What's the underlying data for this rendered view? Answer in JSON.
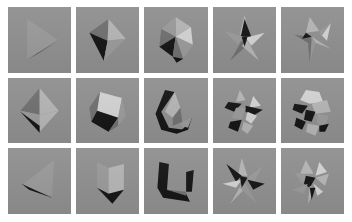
{
  "figure": {
    "kind": "image-grid",
    "rows": 3,
    "columns": 5,
    "background_color": "#ffffff",
    "tile_background_color": "#8f8f8f",
    "gutter_color": "#ffffff"
  },
  "palette": {
    "tile_bg": "#8f8f8f",
    "face_light": "#d2d2d2",
    "face_mid_light": "#b4b4b4",
    "face_mid": "#999999",
    "face_mid_dark": "#6f6f6f",
    "face_dark": "#3a3a3a",
    "face_black": "#141414",
    "page_bg": "#ffffff"
  },
  "tiles": [
    {
      "index": 1,
      "row": 1,
      "column": 1,
      "name": "right-pointing-triangle",
      "shape_label": "Triangle with dark sliver",
      "faces": [
        {
          "id": "r1c1-f1",
          "tone": "face_mid",
          "points": "20,12 20,52 52,33"
        },
        {
          "id": "r1c1-f2",
          "tone": "face_black",
          "points": "22,52 52,34 31,47"
        }
      ]
    },
    {
      "index": 2,
      "row": 1,
      "column": 2,
      "name": "tetrahedron-dark-face",
      "shape_label": "Tetrahedron",
      "faces": [
        {
          "id": "r1c2-f1",
          "tone": "face_mid_dark",
          "points": "14,26 34,12 33,34"
        },
        {
          "id": "r1c2-f2",
          "tone": "face_black",
          "points": "14,26 33,34 29,54"
        },
        {
          "id": "r1c2-f3",
          "tone": "face_mid_light",
          "points": "34,12 52,32 33,34"
        },
        {
          "id": "r1c2-f4",
          "tone": "face_mid",
          "points": "33,34 52,32 29,54"
        }
      ]
    },
    {
      "index": 3,
      "row": 1,
      "column": 3,
      "name": "icosahedron",
      "shape_label": "Icosahedron",
      "faces": [
        {
          "id": "r1c3-f1",
          "tone": "face_mid_light",
          "points": "33,10 49,20 33,30"
        },
        {
          "id": "r1c3-f2",
          "tone": "face_mid",
          "points": "33,10 33,30 18,22"
        },
        {
          "id": "r1c3-f3",
          "tone": "face_mid_dark",
          "points": "18,22 33,30 16,40"
        },
        {
          "id": "r1c3-f4",
          "tone": "face_black",
          "points": "16,40 33,30 30,50"
        },
        {
          "id": "r1c3-f5",
          "tone": "face_light",
          "points": "33,30 49,20 51,38"
        },
        {
          "id": "r1c3-f6",
          "tone": "face_mid",
          "points": "33,30 51,38 41,52"
        },
        {
          "id": "r1c3-f7",
          "tone": "face_mid_dark",
          "points": "30,50 33,30 41,52"
        },
        {
          "id": "r1c3-f8",
          "tone": "face_black",
          "points": "30,50 41,52 34,56"
        }
      ]
    },
    {
      "index": 4,
      "row": 1,
      "column": 4,
      "name": "five-point-star-stellation",
      "shape_label": "Stellated star polyhedron",
      "faces": [
        {
          "id": "r1c4-f1",
          "tone": "face_mid_light",
          "points": "33,8 38,28 28,28"
        },
        {
          "id": "r1c4-f2",
          "tone": "face_black",
          "points": "33,12 40,30 29,30"
        },
        {
          "id": "r1c4-f3",
          "tone": "face_mid",
          "points": "12,24 32,30 26,38"
        },
        {
          "id": "r1c4-f4",
          "tone": "face_light",
          "points": "54,26 34,31 40,39"
        },
        {
          "id": "r1c4-f5",
          "tone": "face_mid_dark",
          "points": "18,54 30,34 36,38"
        },
        {
          "id": "r1c4-f6",
          "tone": "face_mid_light",
          "points": "48,54 36,34 30,39"
        },
        {
          "id": "r1c4-f7",
          "tone": "face_black",
          "points": "30,30 36,30 33,40"
        }
      ]
    },
    {
      "index": 5,
      "row": 1,
      "column": 5,
      "name": "four-point-star-spike",
      "shape_label": "Four-pointed spiked polyhedron",
      "faces": [
        {
          "id": "r1c5-f1",
          "tone": "face_mid_light",
          "points": "30,10 40,24 26,26"
        },
        {
          "id": "r1c5-f2",
          "tone": "face_light",
          "points": "52,16 42,28 48,34"
        },
        {
          "id": "r1c5-f3",
          "tone": "face_mid",
          "points": "40,24 52,16 42,30"
        },
        {
          "id": "r1c5-f4",
          "tone": "face_mid_dark",
          "points": "14,28 32,30 28,36"
        },
        {
          "id": "r1c5-f5",
          "tone": "face_black",
          "points": "26,26 32,30 22,32"
        },
        {
          "id": "r1c5-f6",
          "tone": "face_mid_light",
          "points": "32,30 52,42 36,36"
        },
        {
          "id": "r1c5-f7",
          "tone": "face_mid",
          "points": "32,32 36,36 30,56"
        },
        {
          "id": "r1c5-f8",
          "tone": "face_mid_dark",
          "points": "28,32 32,32 30,56"
        }
      ]
    },
    {
      "index": 6,
      "row": 2,
      "column": 1,
      "name": "octahedron",
      "shape_label": "Octahedron",
      "faces": [
        {
          "id": "r2c1-f1",
          "tone": "face_mid_dark",
          "points": "33,10 13,33 33,37"
        },
        {
          "id": "r2c1-f2",
          "tone": "face_mid_light",
          "points": "33,10 53,33 33,37"
        },
        {
          "id": "r2c1-f3",
          "tone": "face_mid",
          "points": "13,33 33,37 33,54"
        },
        {
          "id": "r2c1-f4",
          "tone": "face_mid_light",
          "points": "53,33 33,37 33,54"
        },
        {
          "id": "r2c1-f5",
          "tone": "face_black",
          "points": "13,34 33,55 33,48"
        }
      ]
    },
    {
      "index": 7,
      "row": 2,
      "column": 2,
      "name": "cuboctahedron",
      "shape_label": "Cuboctahedron",
      "faces": [
        {
          "id": "r2c2-f1",
          "tone": "face_light",
          "points": "25,14 48,20 44,40 22,33"
        },
        {
          "id": "r2c2-f2",
          "tone": "face_mid_dark",
          "points": "14,30 25,14 22,33 16,44"
        },
        {
          "id": "r2c2-f3",
          "tone": "face_mid",
          "points": "48,20 52,38 44,48 44,40"
        },
        {
          "id": "r2c2-f4",
          "tone": "face_black",
          "points": "16,44 22,33 44,40 34,54"
        },
        {
          "id": "r2c2-f5",
          "tone": "face_mid_dark",
          "points": "34,54 44,40 44,48"
        }
      ]
    },
    {
      "index": 8,
      "row": 2,
      "column": 3,
      "name": "crescent-solid",
      "shape_label": "Crescent-shaped solid",
      "faces": [
        {
          "id": "r2c3-f1",
          "tone": "face_black",
          "points": "22,12 32,14 18,34 26,50 42,52 34,56 18,52 12,36"
        },
        {
          "id": "r2c3-f2",
          "tone": "face_black",
          "points": "50,40 46,52 34,56 42,50"
        },
        {
          "id": "r2c3-f3",
          "tone": "face_mid_light",
          "points": "32,14 38,30 30,40 22,34"
        },
        {
          "id": "r2c3-f4",
          "tone": "face_mid_dark",
          "points": "30,40 38,30 40,44 30,48"
        },
        {
          "id": "r2c3-f5",
          "tone": "face_mid",
          "points": "40,44 50,40 46,50 38,48"
        }
      ]
    },
    {
      "index": 9,
      "row": 2,
      "column": 4,
      "name": "faceted-cluster-a",
      "shape_label": "Complex faceted cluster",
      "faces": [
        {
          "id": "r2c4-f1",
          "tone": "face_mid_light",
          "points": "28,12 34,22 24,24"
        },
        {
          "id": "r2c4-f2",
          "tone": "face_black",
          "points": "16,24 30,26 22,34 12,30"
        },
        {
          "id": "r2c4-f3",
          "tone": "face_light",
          "points": "42,18 50,28 38,30"
        },
        {
          "id": "r2c4-f4",
          "tone": "face_black",
          "points": "34,28 52,32 42,38 34,34"
        },
        {
          "id": "r2c4-f5",
          "tone": "face_mid",
          "points": "24,30 34,30 30,42 20,40"
        },
        {
          "id": "r2c4-f6",
          "tone": "face_light",
          "points": "36,34 46,38 40,46 34,42"
        },
        {
          "id": "r2c4-f7",
          "tone": "face_black",
          "points": "18,44 30,42 26,54 16,50"
        },
        {
          "id": "r2c4-f8",
          "tone": "face_mid_light",
          "points": "32,44 42,48 36,56 30,52"
        }
      ]
    },
    {
      "index": 10,
      "row": 2,
      "column": 5,
      "name": "faceted-sphere-cluster",
      "shape_label": "Faceted sphere-like cluster",
      "faces": [
        {
          "id": "r2c5-f1",
          "tone": "face_light",
          "points": "26,12 40,14 44,24 30,26 20,22"
        },
        {
          "id": "r2c5-f2",
          "tone": "face_black",
          "points": "14,26 28,28 22,36 12,32"
        },
        {
          "id": "r2c5-f3",
          "tone": "face_mid_light",
          "points": "32,26 48,22 52,34 36,36"
        },
        {
          "id": "r2c5-f4",
          "tone": "face_black",
          "points": "26,32 36,34 32,44 24,42"
        },
        {
          "id": "r2c5-f5",
          "tone": "face_mid",
          "points": "38,36 50,38 46,48 38,46"
        },
        {
          "id": "r2c5-f6",
          "tone": "face_black",
          "points": "16,40 26,44 22,52 14,48"
        },
        {
          "id": "r2c5-f7",
          "tone": "face_mid_light",
          "points": "28,46 40,48 36,58 26,54"
        },
        {
          "id": "r2c5-f8",
          "tone": "face_black",
          "points": "40,48 50,46 46,54 40,54"
        }
      ]
    },
    {
      "index": 11,
      "row": 3,
      "column": 1,
      "name": "flat-triangle-sliver",
      "shape_label": "Flat triangle with dark sliver",
      "faces": [
        {
          "id": "r3c1-f1",
          "tone": "face_mid",
          "points": "48,12 46,48 14,38"
        },
        {
          "id": "r3c1-f2",
          "tone": "face_black",
          "points": "14,36 46,50 22,42"
        }
      ]
    },
    {
      "index": 12,
      "row": 3,
      "column": 2,
      "name": "cube",
      "shape_label": "Cube",
      "faces": [
        {
          "id": "r3c2-f1",
          "tone": "face_mid",
          "points": "22,14 34,20 34,46 22,40"
        },
        {
          "id": "r3c2-f2",
          "tone": "face_mid_light",
          "points": "34,20 50,16 50,42 34,46"
        },
        {
          "id": "r3c2-f3",
          "tone": "face_black",
          "points": "22,40 34,46 50,42 38,56"
        }
      ]
    },
    {
      "index": 13,
      "row": 3,
      "column": 3,
      "name": "hook-solid",
      "shape_label": "Hook / boomerang solid",
      "faces": [
        {
          "id": "r3c3-f1",
          "tone": "face_black",
          "points": "16,14 26,16 24,42 44,46 48,54 20,50 14,40"
        },
        {
          "id": "r3c3-f2",
          "tone": "face_black",
          "points": "44,24 52,22 50,44 44,44"
        },
        {
          "id": "r3c3-f3",
          "tone": "face_mid_dark",
          "points": "24,42 44,44 44,48"
        }
      ]
    },
    {
      "index": 14,
      "row": 3,
      "column": 4,
      "name": "six-point-star-stellation",
      "shape_label": "Six-pointed stellation",
      "faces": [
        {
          "id": "r3c4-f1",
          "tone": "face_mid_light",
          "points": "30,10 36,28 26,28"
        },
        {
          "id": "r3c4-f2",
          "tone": "face_black",
          "points": "14,16 30,28 24,34"
        },
        {
          "id": "r3c4-f3",
          "tone": "face_mid",
          "points": "52,18 36,30 42,36"
        },
        {
          "id": "r3c4-f4",
          "tone": "face_light",
          "points": "10,36 30,32 24,40"
        },
        {
          "id": "r3c4-f5",
          "tone": "face_black",
          "points": "54,36 36,32 42,42"
        },
        {
          "id": "r3c4-f6",
          "tone": "face_mid_light",
          "points": "18,56 30,36 34,40"
        },
        {
          "id": "r3c4-f7",
          "tone": "face_mid",
          "points": "46,56 34,36 28,40"
        },
        {
          "id": "r3c4-f8",
          "tone": "face_black",
          "points": "28,28 36,30 30,40"
        }
      ]
    },
    {
      "index": 15,
      "row": 3,
      "column": 5,
      "name": "spiked-ball",
      "shape_label": "Spiked stellated ball",
      "faces": [
        {
          "id": "r3c5-f1",
          "tone": "face_mid_light",
          "points": "26,12 34,26 20,26"
        },
        {
          "id": "r3c5-f2",
          "tone": "face_light",
          "points": "40,14 48,24 36,28"
        },
        {
          "id": "r3c5-f3",
          "tone": "face_mid",
          "points": "14,24 30,28 22,36"
        },
        {
          "id": "r3c5-f4",
          "tone": "face_mid_light",
          "points": "50,26 36,30 46,38"
        },
        {
          "id": "r3c5-f5",
          "tone": "face_black",
          "points": "26,28 36,30 30,40 24,36"
        },
        {
          "id": "r3c5-f6",
          "tone": "face_mid",
          "points": "12,42 28,36 24,46"
        },
        {
          "id": "r3c5-f7",
          "tone": "face_light",
          "points": "44,44 34,36 38,48"
        },
        {
          "id": "r3c5-f8",
          "tone": "face_mid_light",
          "points": "28,56 30,38 36,42"
        },
        {
          "id": "r3c5-f9",
          "tone": "face_black",
          "points": "30,40 36,40 32,52"
        }
      ]
    }
  ]
}
